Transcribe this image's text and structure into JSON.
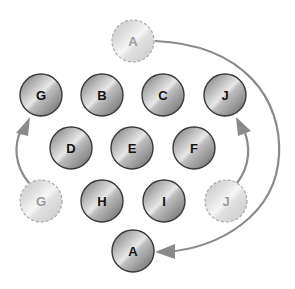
{
  "diagram": {
    "colors": {
      "arrow": "#8a8a8a",
      "ball_outline": "#3a3a3a",
      "ghost_outline": "#a8a8a8",
      "label": "#111111",
      "ghost_label": "#9a9a9a"
    },
    "balls": [
      {
        "id": "G",
        "label": "G",
        "state": "solid"
      },
      {
        "id": "B",
        "label": "B",
        "state": "solid"
      },
      {
        "id": "C",
        "label": "C",
        "state": "solid"
      },
      {
        "id": "J",
        "label": "J",
        "state": "solid"
      },
      {
        "id": "D",
        "label": "D",
        "state": "solid"
      },
      {
        "id": "E",
        "label": "E",
        "state": "solid"
      },
      {
        "id": "F",
        "label": "F",
        "state": "solid"
      },
      {
        "id": "H",
        "label": "H",
        "state": "solid"
      },
      {
        "id": "I",
        "label": "I",
        "state": "solid"
      },
      {
        "id": "A",
        "label": "A",
        "state": "solid"
      }
    ],
    "ghosts": [
      {
        "id": "ghost-A",
        "label": "A",
        "state": "ghost"
      },
      {
        "id": "ghost-G",
        "label": "G",
        "state": "ghost"
      },
      {
        "id": "ghost-J",
        "label": "J",
        "state": "ghost"
      }
    ],
    "moves": [
      {
        "from": "ghost-A",
        "to": "A"
      },
      {
        "from": "ghost-G",
        "to": "G"
      },
      {
        "from": "ghost-J",
        "to": "J"
      }
    ]
  }
}
